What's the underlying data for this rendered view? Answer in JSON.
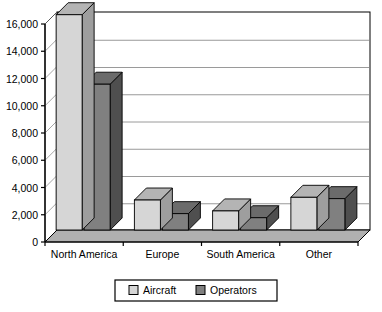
{
  "chart_data": {
    "type": "bar",
    "title": "",
    "subtitle": "",
    "xlabel": "",
    "ylabel": "",
    "categories": [
      "North America",
      "Europe",
      "South America",
      "Other"
    ],
    "series": [
      {
        "name": "Aircraft",
        "values": [
          15800,
          2200,
          1400,
          2400
        ],
        "color": "#d6d6d6"
      },
      {
        "name": "Operators",
        "values": [
          10700,
          1200,
          900,
          2300
        ],
        "color": "#808080"
      }
    ],
    "ylim": [
      0,
      16000
    ],
    "ytick_labels": [
      "16,000",
      "14,000",
      "12,000",
      "10,000",
      "8,000",
      "6,000",
      "4,000",
      "2,000",
      "0"
    ],
    "ytick_values": [
      16000,
      14000,
      12000,
      10000,
      8000,
      6000,
      4000,
      2000,
      0
    ],
    "grid": true,
    "legend_position": "bottom",
    "legend_entries": [
      {
        "label": "Aircraft",
        "swatch": "#d6d6d6"
      },
      {
        "label": "Operators",
        "swatch": "#808080"
      }
    ],
    "style": "3d-column",
    "colors": {
      "aircraft_front": "#d6d6d6",
      "aircraft_top": "#b4b4b4",
      "aircraft_side": "#9e9e9e",
      "operators_front": "#808080",
      "operators_top": "#6b6b6b",
      "operators_side": "#4f4f4f",
      "floor": "#b0b0b0",
      "wall": "#ffffff",
      "grid_line": "#808080",
      "frame": "#000000"
    }
  }
}
